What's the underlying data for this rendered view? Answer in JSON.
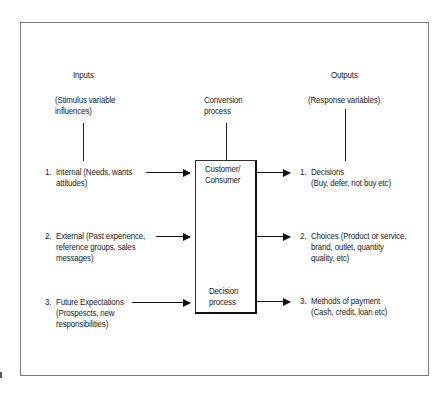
{
  "diagram": {
    "columns": {
      "inputs": {
        "title": "Inputs",
        "subtitle_line1": "(Stimulus variable",
        "subtitle_line2": "influences)"
      },
      "conversion": {
        "title_line1": "Conversion",
        "title_line2": "process"
      },
      "outputs": {
        "title": "Outputs",
        "subtitle": "(Response variables)"
      }
    },
    "center_box": {
      "top_label_line1": "Customer/",
      "top_label_line2": "Consumer",
      "bottom_label_line1": "Decision",
      "bottom_label_line2": "process"
    },
    "inputs": [
      {
        "num": "1.",
        "line1": "Internal (Needs, wants",
        "line2": "attitudes)"
      },
      {
        "num": "2.",
        "line1": "External (Past experience,",
        "line2": "reference groups,  sales",
        "line3": "messages)"
      },
      {
        "num": "3.",
        "line1": "Future Expectations",
        "line2": "(Prospescts, new",
        "line3": "responsibilities)"
      }
    ],
    "outputs": [
      {
        "num": "1.",
        "line1": "Decisions",
        "line2": "(Buy, defer, not buy etc)"
      },
      {
        "num": "2.",
        "line1": "Choices (Product or service,",
        "line2": "brand, outlet, quantity",
        "line3": "quality, etc)"
      },
      {
        "num": "3.",
        "line1": "Methods of payment",
        "line2": "(Cash, credit, loan etc)"
      }
    ],
    "colors": {
      "line": "#111111",
      "frame": "#7a7a7a",
      "text": "#1a1a1a"
    }
  }
}
